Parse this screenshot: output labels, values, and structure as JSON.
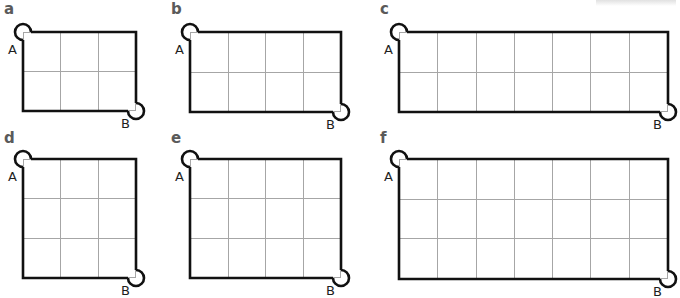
{
  "panels": [
    {
      "label": "a",
      "rows": 2,
      "cols": 3,
      "start": "A",
      "end": "B"
    },
    {
      "label": "b",
      "rows": 2,
      "cols": 4,
      "start": "A",
      "end": "B"
    },
    {
      "label": "c",
      "rows": 2,
      "cols": 7,
      "start": "A",
      "end": "B"
    },
    {
      "label": "d",
      "rows": 3,
      "cols": 3,
      "start": "A",
      "end": "B"
    },
    {
      "label": "e",
      "rows": 3,
      "cols": 4,
      "start": "A",
      "end": "B"
    },
    {
      "label": "f",
      "rows": 3,
      "cols": 7,
      "start": "A",
      "end": "B"
    }
  ],
  "colors": {
    "outline": "#111111",
    "grid_line": "#a6a6a6",
    "panel_label": "#5a5a5a",
    "point_label": "#1e1e1e"
  }
}
